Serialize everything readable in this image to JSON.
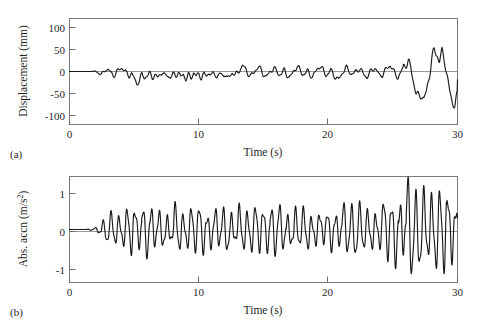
{
  "figure": {
    "width": 478,
    "height": 327,
    "background": "#ffffff",
    "trace_color": "#1a1a1a",
    "axis_color": "#6b6b6b"
  },
  "panels": [
    {
      "tag": "(a)",
      "xlabel": "Time (s)",
      "ylabel_main": "Displacement (mm)",
      "ylabel_prefix": "Displacement (mm)",
      "ylabel_sup": "",
      "xticks": [
        "0",
        "10",
        "20",
        "30"
      ],
      "yticks": [
        "100",
        "50",
        "0",
        "-50",
        "-100"
      ]
    },
    {
      "tag": "(b)",
      "xlabel": "Time (s)",
      "ylabel_main": "Abs. accn (m/s2)",
      "ylabel_prefix": "Abs. accn (m/s",
      "ylabel_sup": "2",
      "xticks": [
        "0",
        "10",
        "20",
        "30"
      ],
      "yticks": [
        "1",
        "0",
        "-1"
      ]
    }
  ],
  "chart_data": [
    {
      "type": "line",
      "panel": "(a)",
      "title": "",
      "xlabel": "Time (s)",
      "ylabel": "Displacement (mm)",
      "xlim": [
        0,
        30
      ],
      "ylim": [
        -125,
        125
      ],
      "xticks": [
        0,
        10,
        20,
        30
      ],
      "yticks": [
        100,
        50,
        0,
        -50,
        -100
      ],
      "grid": false,
      "legend": "none",
      "series": [
        {
          "name": "Displacement",
          "units": "mm",
          "x": [
            0.0,
            0.5,
            1.0,
            1.5,
            2.0,
            2.2,
            2.4,
            2.6,
            2.8,
            3.0,
            3.2,
            3.4,
            3.6,
            3.8,
            4.0,
            4.2,
            4.4,
            4.6,
            4.8,
            5.0,
            5.2,
            5.4,
            5.6,
            5.8,
            6.0,
            6.2,
            6.4,
            6.6,
            6.8,
            7.0,
            7.2,
            7.4,
            7.6,
            7.8,
            8.0,
            8.2,
            8.4,
            8.6,
            8.8,
            9.0,
            9.2,
            9.4,
            9.6,
            9.8,
            10.0,
            10.2,
            10.4,
            10.6,
            10.8,
            11.0,
            11.2,
            11.4,
            11.6,
            11.8,
            12.0,
            12.2,
            12.4,
            12.6,
            12.8,
            13.0,
            13.2,
            13.4,
            13.6,
            13.8,
            14.0,
            14.2,
            14.4,
            14.6,
            14.8,
            15.0,
            15.2,
            15.4,
            15.6,
            15.8,
            16.0,
            16.2,
            16.4,
            16.6,
            16.8,
            17.0,
            17.2,
            17.4,
            17.6,
            17.8,
            18.0,
            18.2,
            18.4,
            18.6,
            18.8,
            19.0,
            19.2,
            19.4,
            19.6,
            19.8,
            20.0,
            20.2,
            20.4,
            20.6,
            20.8,
            21.0,
            21.2,
            21.4,
            21.6,
            21.8,
            22.0,
            22.2,
            22.4,
            22.6,
            22.8,
            23.0,
            23.2,
            23.4,
            23.6,
            23.8,
            24.0,
            24.2,
            24.4,
            24.6,
            24.8,
            25.0,
            25.2,
            25.4,
            25.6,
            25.8,
            26.0,
            26.2,
            26.4,
            26.6,
            26.8,
            27.0,
            27.2,
            27.4,
            27.6,
            27.8,
            28.0,
            28.2,
            28.4,
            28.6,
            28.8,
            29.0,
            29.2,
            29.4,
            29.6,
            29.8,
            30.0
          ],
          "y": [
            0,
            0,
            0,
            0,
            1,
            -3,
            -7,
            -2,
            4,
            2,
            -4,
            -8,
            -3,
            5,
            9,
            3,
            -6,
            -10,
            -4,
            -14,
            -28,
            -22,
            -8,
            -16,
            -10,
            -3,
            -12,
            -7,
            -16,
            -9,
            -2,
            -12,
            -6,
            -14,
            -5,
            -12,
            -3,
            -14,
            -6,
            -16,
            -7,
            -15,
            -4,
            -13,
            -6,
            -14,
            -4,
            -10,
            -2,
            -11,
            -5,
            -13,
            -3,
            -9,
            -4,
            -18,
            -12,
            -3,
            -8,
            -2,
            8,
            14,
            5,
            -6,
            -12,
            -4,
            6,
            12,
            4,
            -8,
            -14,
            -6,
            4,
            10,
            2,
            -8,
            -6,
            2,
            -7,
            -13,
            -5,
            5,
            11,
            3,
            -7,
            -5,
            3,
            -6,
            -12,
            -3,
            6,
            12,
            4,
            -6,
            -4,
            4,
            -8,
            -16,
            -20,
            -8,
            4,
            10,
            2,
            -8,
            -6,
            2,
            8,
            2,
            -8,
            -14,
            -6,
            3,
            9,
            1,
            -9,
            -7,
            1,
            7,
            14,
            6,
            -6,
            -12,
            -4,
            8,
            16,
            20,
            10,
            -20,
            -50,
            -62,
            -55,
            -70,
            -48,
            -10,
            30,
            52,
            40,
            20,
            44,
            30,
            -10,
            -45,
            -72,
            -80,
            -58,
            -30,
            -52,
            -68,
            -45,
            -32
          ]
        }
      ]
    },
    {
      "type": "line",
      "panel": "(b)",
      "title": "",
      "xlabel": "Time (s)",
      "ylabel": "Abs. accn (m/s2)",
      "xlim": [
        0,
        30
      ],
      "ylim": [
        -1.55,
        1.55
      ],
      "xticks": [
        0,
        10,
        20,
        30
      ],
      "yticks": [
        1,
        0,
        -1
      ],
      "grid": false,
      "legend": "none",
      "series": [
        {
          "name": "Absolute acceleration",
          "units": "m/s2",
          "description": "Growing oscillation, near zero until t=2 s, steady ~0.5 amplitude from 5-24 s, peaks near 1.1 after t=26 s",
          "envelope_x": [
            0,
            2,
            3,
            5,
            8,
            12,
            16,
            20,
            24,
            26,
            28,
            30
          ],
          "envelope_y": [
            0.0,
            0.05,
            0.35,
            0.6,
            0.5,
            0.55,
            0.55,
            0.5,
            0.6,
            1.05,
            0.95,
            1.0
          ],
          "dominant_period_s": 0.62
        }
      ]
    }
  ]
}
